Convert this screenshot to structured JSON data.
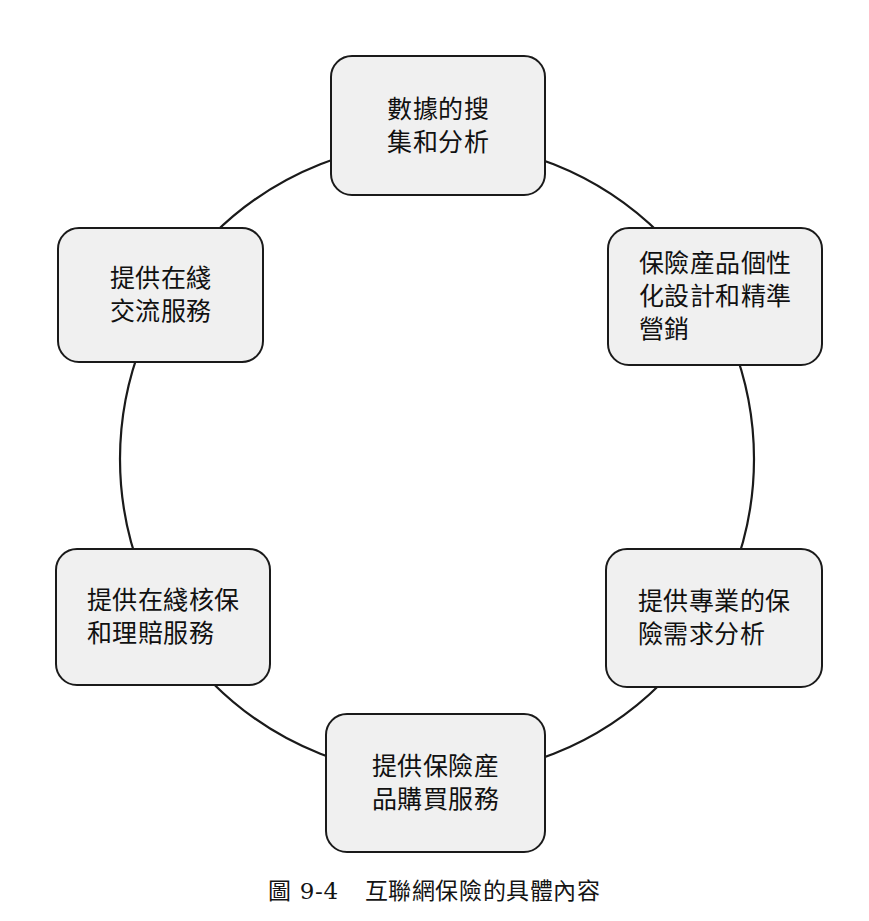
{
  "figure": {
    "caption_number": "圖 9-4",
    "caption_title": "互聯網保險的具體內容",
    "ring": {
      "center_x": 437,
      "center_y": 459,
      "radius": 317,
      "stroke_color": "#1a1a1a",
      "stroke_width": 2.2,
      "fill": "none"
    },
    "style": {
      "node_fill": "#f0f0f0",
      "node_border": "#1a1a1a",
      "text_color": "#111111",
      "background": "#ffffff"
    }
  },
  "nodes": [
    {
      "id": "data-collection-analysis",
      "position": "top",
      "label": "數據的搜\n集和分析",
      "lines": [
        "數據的搜",
        "集和分析"
      ]
    },
    {
      "id": "personalized-product-design-marketing",
      "position": "right-top",
      "label": "保險産品個性\n化設計和精準\n營銷",
      "lines": [
        "保險産品個性",
        "化設計和精準",
        "營銷"
      ]
    },
    {
      "id": "professional-insurance-needs-analysis",
      "position": "right-bottom",
      "label": "提供專業的保\n險需求分析",
      "lines": [
        "提供專業的保",
        "險需求分析"
      ]
    },
    {
      "id": "insurance-product-purchase-service",
      "position": "bottom",
      "label": "提供保險産\n品購買服務",
      "lines": [
        "提供保險産",
        "品購買服務"
      ]
    },
    {
      "id": "online-underwriting-claims-service",
      "position": "left-bottom",
      "label": "提供在綫核保\n和理賠服務",
      "lines": [
        "提供在綫核保",
        "和理賠服務"
      ]
    },
    {
      "id": "online-communication-service",
      "position": "left-top",
      "label": "提供在綫\n交流服務",
      "lines": [
        "提供在綫",
        "交流服務"
      ]
    }
  ]
}
